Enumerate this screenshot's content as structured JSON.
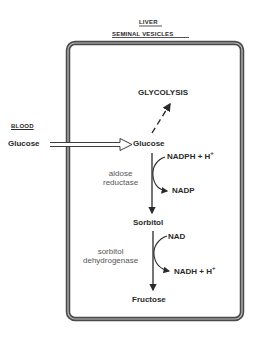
{
  "header": {
    "organ_1": "LIVER",
    "organ_2": "SEMINAL VESICLES"
  },
  "outside": {
    "compartment_label": "BLOOD",
    "substrate": "Glucose"
  },
  "cell": {
    "glucose": "Glucose",
    "glycolysis": "GLYCOLYSIS",
    "sorbitol": "Sorbitol",
    "fructose": "Fructose",
    "step1": {
      "enzyme_line1": "aldose",
      "enzyme_line2": "reductase",
      "cofactor_in": "NADPH + H",
      "cofactor_in_sup": "+",
      "cofactor_out": "NADP"
    },
    "step2": {
      "enzyme_line1": "sorbitol",
      "enzyme_line2": "dehydrogenase",
      "cofactor_in": "NAD",
      "cofactor_out": "NADH + H",
      "cofactor_out_sup": "+"
    }
  },
  "colors": {
    "ink": "#2a2a2a",
    "border": "#555555",
    "enzyme_text": "#555555"
  }
}
